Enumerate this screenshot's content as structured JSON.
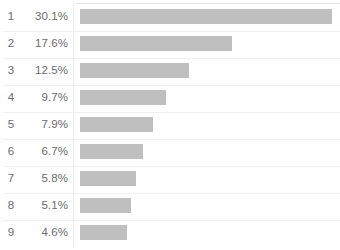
{
  "chart_data": {
    "type": "bar",
    "orientation": "horizontal",
    "title": "",
    "subtitle": "",
    "xlabel": "",
    "ylabel": "",
    "grid": false,
    "legend": null,
    "axis_ticks": [],
    "xlim": [
      0,
      30.1
    ],
    "categories": [
      "1",
      "2",
      "3",
      "4",
      "5",
      "6",
      "7",
      "8",
      "9"
    ],
    "values": [
      30.1,
      17.6,
      12.5,
      9.7,
      7.9,
      6.7,
      5.8,
      5.1,
      4.6
    ],
    "value_labels": [
      "30.1%",
      "17.6%",
      "12.5%",
      "9.7%",
      "7.9%",
      "6.7%",
      "5.8%",
      "5.1%",
      "4.6%"
    ],
    "bar_color": "#bfbfbf",
    "text_color": "#6b6b6b",
    "background_color": "#ffffff",
    "separator_color": "#efefef"
  },
  "rows": [
    {
      "rank": "1",
      "percent": "30.1%",
      "bar_width_px": 252
    },
    {
      "rank": "2",
      "percent": "17.6%",
      "bar_width_px": 152
    },
    {
      "rank": "3",
      "percent": "12.5%",
      "bar_width_px": 109
    },
    {
      "rank": "4",
      "percent": "9.7%",
      "bar_width_px": 86
    },
    {
      "rank": "5",
      "percent": "7.9%",
      "bar_width_px": 73
    },
    {
      "rank": "6",
      "percent": "6.7%",
      "bar_width_px": 63
    },
    {
      "rank": "7",
      "percent": "5.8%",
      "bar_width_px": 56
    },
    {
      "rank": "8",
      "percent": "5.1%",
      "bar_width_px": 51
    },
    {
      "rank": "9",
      "percent": "4.6%",
      "bar_width_px": 47
    }
  ]
}
